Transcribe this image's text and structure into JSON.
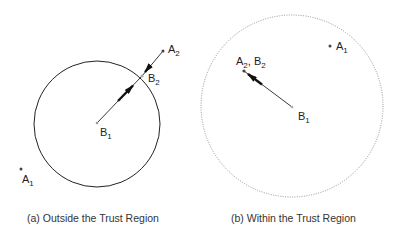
{
  "panels": [
    {
      "id": "a",
      "caption": "(a) Outside the Trust Region",
      "region": {
        "style": "solid",
        "center": [
          97,
          124
        ],
        "radius": 63
      },
      "points": {
        "A1": {
          "label": "A",
          "sub": "1",
          "pos": [
            21,
            169
          ]
        },
        "A2": {
          "label": "A",
          "sub": "2",
          "pos": [
            163,
            51
          ]
        },
        "B1": {
          "label": "B",
          "sub": "1",
          "pos": [
            97,
            123
          ]
        },
        "B2": {
          "label": "B",
          "sub": "2",
          "pos": [
            142,
            76
          ]
        }
      }
    },
    {
      "id": "b",
      "caption": "(b) Within the Trust Region",
      "region": {
        "style": "dotted",
        "center": [
          292,
          106
        ],
        "radius": 90
      },
      "points": {
        "A1": {
          "label": "A",
          "sub": "1",
          "pos": [
            330,
            46
          ]
        },
        "A2B2": {
          "label": "A",
          "sub": "2",
          "label2": "B",
          "sub2": "2",
          "sep": ", ",
          "pos": [
            244,
            71
          ]
        },
        "B1": {
          "label": "B",
          "sub": "1",
          "pos": [
            292,
            107
          ]
        }
      }
    }
  ],
  "colors": {
    "stroke": "#222222",
    "dotted": "#888888",
    "point": "#555555"
  }
}
